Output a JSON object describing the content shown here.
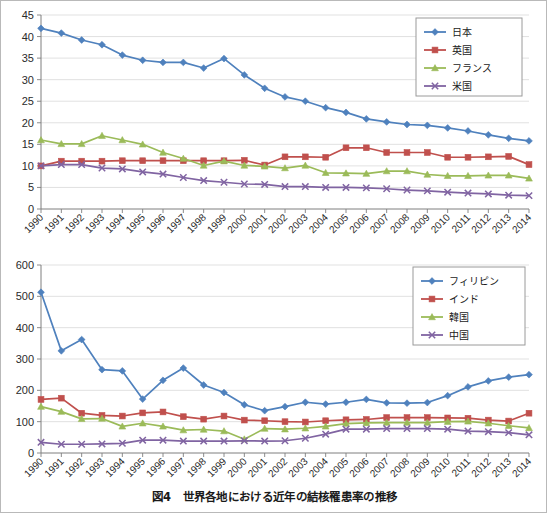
{
  "figure": {
    "caption": "図4　世界各地における近年の結核罹患率の推移",
    "caption_number": "図4",
    "caption_text": "世界各地における近年の結核罹患率の推移"
  },
  "palette": {
    "blue": "#4f81bd",
    "red": "#c0504d",
    "green": "#9bbb59",
    "purple": "#8064a2",
    "grid": "#d9d9d9",
    "axis": "#7f7f7f",
    "text": "#2b2b2b",
    "background": "#ffffff"
  },
  "chart_data": [
    {
      "id": "top",
      "type": "line",
      "title": "",
      "xlabel": "",
      "ylabel": "",
      "grid": true,
      "legend_position": "top-right",
      "ylim": [
        0,
        45
      ],
      "yticks": [
        0,
        5,
        10,
        15,
        20,
        25,
        30,
        35,
        40,
        45
      ],
      "ytick_labels": [
        "0",
        "5",
        "10",
        "15",
        "20",
        "25",
        "30",
        "35",
        "40",
        "45"
      ],
      "categories": [
        "1990",
        "1991",
        "1992",
        "1993",
        "1994",
        "1995",
        "1996",
        "1997",
        "1998",
        "1999",
        "2000",
        "2001",
        "2002",
        "2003",
        "2004",
        "2005",
        "2006",
        "2007",
        "2008",
        "2009",
        "2010",
        "2011",
        "2012",
        "2013",
        "2014"
      ],
      "series": [
        {
          "name": "日本",
          "color": "#4f81bd",
          "marker": "diamond",
          "values": [
            41.9,
            40.8,
            39.2,
            38.1,
            35.7,
            34.5,
            34.0,
            34.0,
            32.7,
            34.9,
            31.1,
            28.0,
            26.0,
            25.0,
            23.5,
            22.4,
            20.9,
            20.2,
            19.6,
            19.4,
            18.8,
            18.1,
            17.2,
            16.4,
            15.8
          ]
        },
        {
          "name": "英国",
          "color": "#c0504d",
          "marker": "square",
          "values": [
            10.0,
            11.1,
            11.1,
            11.1,
            11.2,
            11.2,
            11.2,
            11.2,
            11.2,
            11.2,
            11.3,
            10.2,
            12.1,
            12.1,
            12.0,
            14.2,
            14.2,
            13.1,
            13.1,
            13.1,
            12.0,
            12.0,
            12.1,
            12.2,
            10.3
          ]
        },
        {
          "name": "フランス",
          "color": "#9bbb59",
          "marker": "triangle",
          "values": [
            16.0,
            15.1,
            15.1,
            17.0,
            16.0,
            15.0,
            13.1,
            11.7,
            10.1,
            11.1,
            10.1,
            9.9,
            9.5,
            10.1,
            8.4,
            8.3,
            8.2,
            8.8,
            8.8,
            8.0,
            7.7,
            7.7,
            7.8,
            7.8,
            7.1
          ]
        },
        {
          "name": "米国",
          "color": "#8064a2",
          "marker": "x",
          "values": [
            10.0,
            10.3,
            10.3,
            9.5,
            9.3,
            8.6,
            8.1,
            7.3,
            6.6,
            6.2,
            5.8,
            5.7,
            5.2,
            5.2,
            5.0,
            5.0,
            4.9,
            4.7,
            4.4,
            4.2,
            3.9,
            3.7,
            3.5,
            3.2,
            3.1
          ]
        }
      ]
    },
    {
      "id": "bottom",
      "type": "line",
      "title": "",
      "xlabel": "",
      "ylabel": "",
      "grid": true,
      "legend_position": "top-right",
      "ylim": [
        0,
        600
      ],
      "yticks": [
        0,
        100,
        200,
        300,
        400,
        500,
        600
      ],
      "ytick_labels": [
        "0",
        "100",
        "200",
        "300",
        "400",
        "500",
        "600"
      ],
      "categories": [
        "1990",
        "1991",
        "1992",
        "1993",
        "1994",
        "1995",
        "1996",
        "1997",
        "1998",
        "1999",
        "2000",
        "2001",
        "2002",
        "2003",
        "2004",
        "2005",
        "2006",
        "2007",
        "2008",
        "2009",
        "2010",
        "2011",
        "2012",
        "2013",
        "2014"
      ],
      "series": [
        {
          "name": "フィリピン",
          "color": "#4f81bd",
          "marker": "diamond",
          "values": [
            513,
            326,
            362,
            266,
            262,
            172,
            232,
            271,
            217,
            193,
            154,
            135,
            148,
            162,
            156,
            162,
            171,
            160,
            159,
            161,
            183,
            211,
            230,
            242,
            250
          ]
        },
        {
          "name": "インド",
          "color": "#c0504d",
          "marker": "square",
          "values": [
            171,
            175,
            127,
            120,
            118,
            128,
            131,
            116,
            108,
            118,
            105,
            103,
            100,
            99,
            103,
            106,
            107,
            113,
            113,
            113,
            112,
            111,
            105,
            102,
            127
          ]
        },
        {
          "name": "韓国",
          "color": "#9bbb59",
          "marker": "triangle",
          "values": [
            148,
            132,
            109,
            110,
            85,
            95,
            85,
            73,
            75,
            70,
            44,
            78,
            76,
            79,
            85,
            94,
            96,
            97,
            97,
            97,
            100,
            101,
            95,
            87,
            80
          ]
        },
        {
          "name": "中国",
          "color": "#8064a2",
          "marker": "x",
          "values": [
            34,
            28,
            28,
            29,
            31,
            41,
            41,
            38,
            38,
            38,
            39,
            38,
            39,
            47,
            60,
            76,
            76,
            78,
            78,
            78,
            76,
            70,
            68,
            65,
            58
          ]
        }
      ]
    }
  ]
}
